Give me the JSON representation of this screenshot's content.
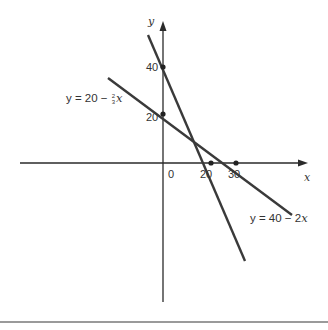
{
  "figure": {
    "axes": {
      "x_label": "x",
      "y_label": "y"
    },
    "ticks": {
      "origin": "0",
      "x": [
        "20",
        "30"
      ],
      "y": [
        "40",
        "20"
      ]
    },
    "lines": [
      {
        "id": "line1",
        "equation_prefix": "y = 40 − 2",
        "equation_var": "x",
        "label": "y = 40 − 2x",
        "y_intercept": 40,
        "x_intercept": 20,
        "slope": -2
      },
      {
        "id": "line2",
        "equation_prefix": "y = 20 − ",
        "frac_num": "2",
        "frac_den": "3",
        "equation_var": "x",
        "label": "y = 20 − (2/3)x",
        "y_intercept": 20,
        "x_intercept": 30,
        "slope": -0.6667
      }
    ],
    "marked_points": [
      {
        "x": 0,
        "y": 40
      },
      {
        "x": 0,
        "y": 20
      },
      {
        "x": 20,
        "y": 0
      },
      {
        "x": 30,
        "y": 0
      },
      {
        "x": 15,
        "y": 10
      }
    ],
    "colors": {
      "line": "#3a3a3a",
      "axis": "#2a2a2a",
      "text": "#333333",
      "rule": "#9a9a9a"
    }
  }
}
